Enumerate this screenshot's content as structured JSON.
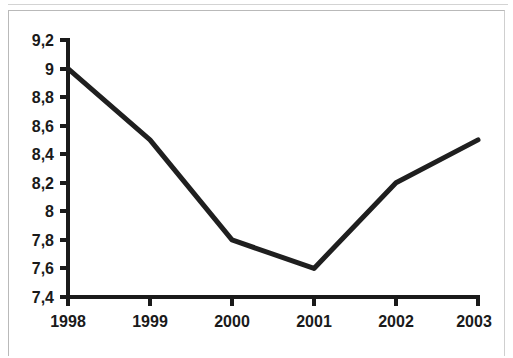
{
  "chart_data": {
    "type": "line",
    "title": "",
    "subtitle": "",
    "xlabel": "",
    "ylabel": "",
    "categories": [
      "1998",
      "1999",
      "2000",
      "2001",
      "2002",
      "2003"
    ],
    "x": [
      1998,
      1999,
      2000,
      2001,
      2002,
      2003
    ],
    "values": [
      9.0,
      8.5,
      7.8,
      7.6,
      8.2,
      8.5
    ],
    "series": [
      {
        "name": "",
        "values": [
          9.0,
          8.5,
          7.8,
          7.6,
          8.2,
          8.5
        ]
      }
    ],
    "ylim": [
      7.4,
      9.2
    ],
    "ytick_values": [
      7.4,
      7.6,
      7.8,
      8.0,
      8.2,
      8.4,
      8.6,
      8.8,
      9.0,
      9.2
    ],
    "ytick_labels": [
      "7,4",
      "7,6",
      "7,8",
      "8",
      "8,2",
      "8,4",
      "8,6",
      "8,8",
      "9",
      "9,2"
    ],
    "xtick_labels": [
      "1998",
      "1999",
      "2000",
      "2001",
      "2002",
      "2003"
    ],
    "decimal_separator": ",",
    "grid": false,
    "legend": false,
    "legend_position": "none",
    "annotations": [],
    "colors": {
      "line": "#1f1f1f",
      "axis": "#1a1a1a",
      "text": "#1a1a1a",
      "background": "#ffffff",
      "frame": "#b9b9b9"
    }
  }
}
